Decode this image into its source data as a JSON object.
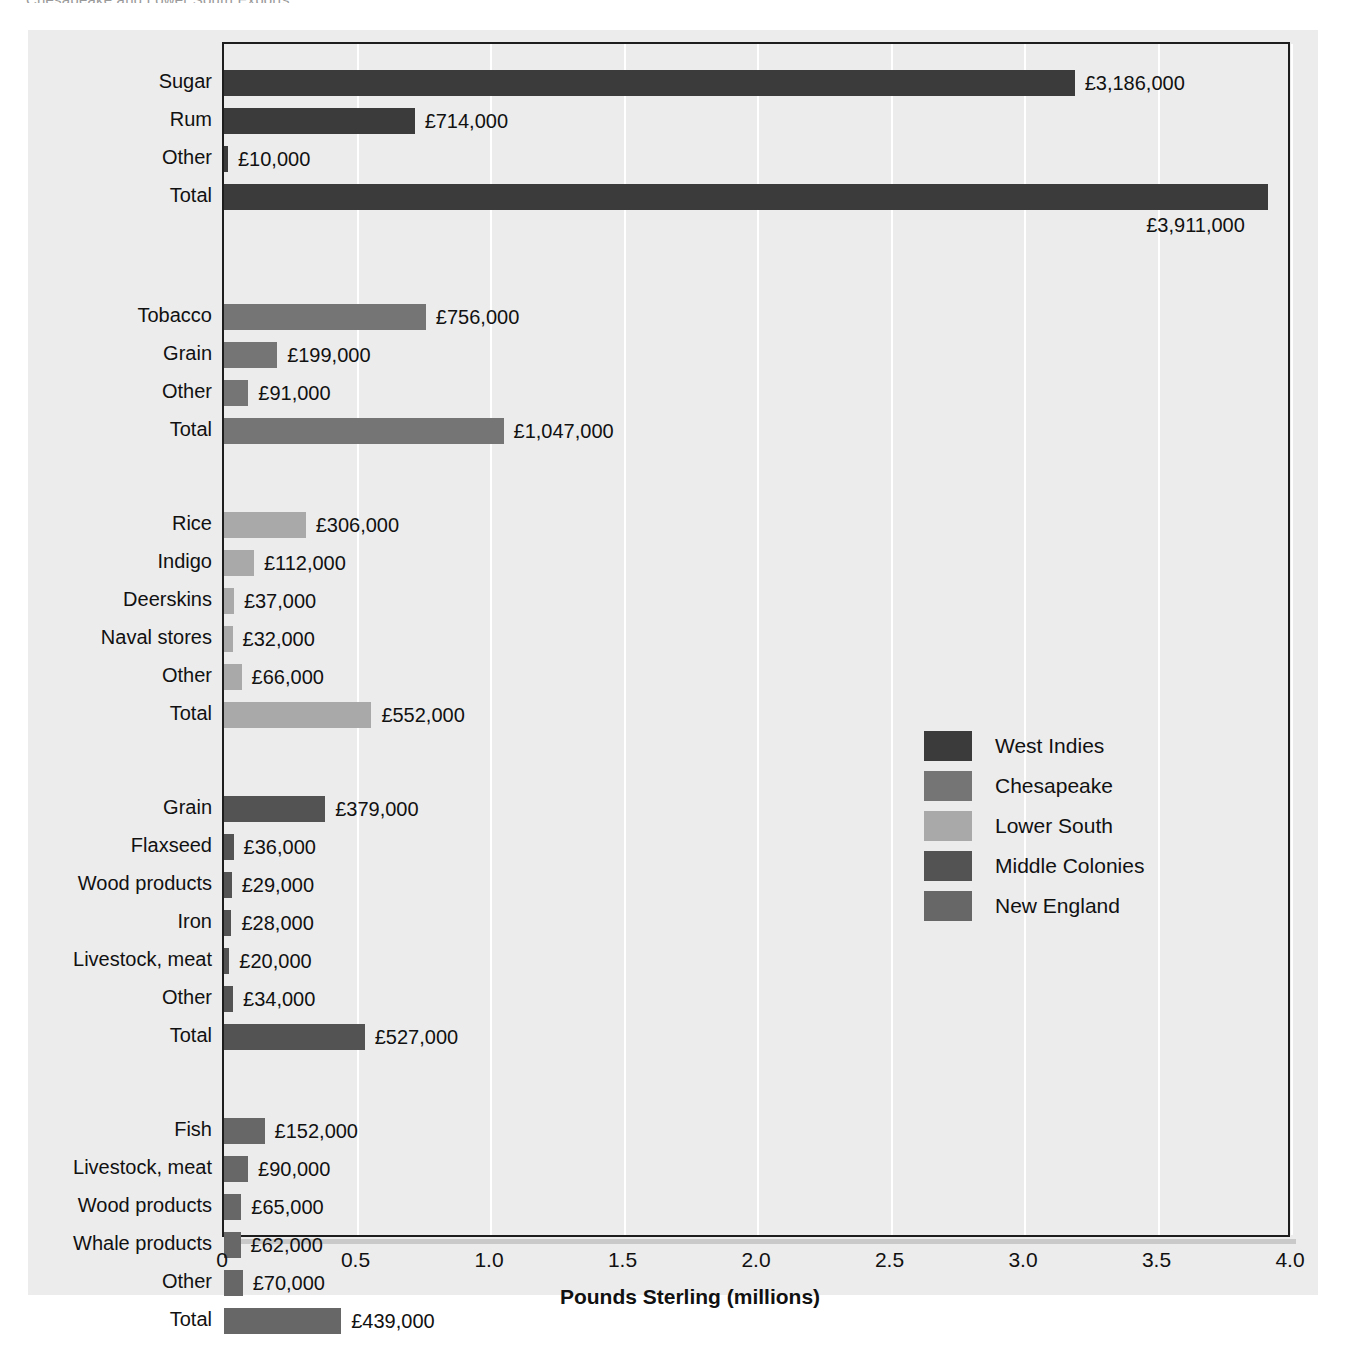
{
  "top_caption": "Chesapeake and Lower South Exports",
  "chart_data": {
    "type": "bar",
    "orientation": "horizontal",
    "title": "",
    "xlabel": "Pounds Sterling (millions)",
    "ylabel": "",
    "xlim": [
      0,
      4.0
    ],
    "xticks": [
      "0",
      "0.5",
      "1.0",
      "1.5",
      "2.0",
      "2.5",
      "3.0",
      "3.5",
      "4.0"
    ],
    "xtick_values": [
      0,
      0.5,
      1.0,
      1.5,
      2.0,
      2.5,
      3.0,
      3.5,
      4.0
    ],
    "grid": true,
    "legend_position": "center-right",
    "value_unit": "pounds sterling",
    "groups": [
      {
        "name": "West Indies",
        "color": "#3b3b3b",
        "items": [
          {
            "label": "Sugar",
            "value": 3186000,
            "value_label": "£3,186,000",
            "millions": 3.186,
            "label_below": false
          },
          {
            "label": "Rum",
            "value": 714000,
            "value_label": "£714,000",
            "millions": 0.714,
            "label_below": false
          },
          {
            "label": "Other",
            "value": 10000,
            "value_label": "£10,000",
            "millions": 0.01,
            "label_below": false
          },
          {
            "label": "Total",
            "value": 3911000,
            "value_label": "£3,911,000",
            "millions": 3.911,
            "label_below": true
          }
        ]
      },
      {
        "name": "Chesapeake",
        "color": "#757575",
        "items": [
          {
            "label": "Tobacco",
            "value": 756000,
            "value_label": "£756,000",
            "millions": 0.756,
            "label_below": false
          },
          {
            "label": "Grain",
            "value": 199000,
            "value_label": "£199,000",
            "millions": 0.199,
            "label_below": false
          },
          {
            "label": "Other",
            "value": 91000,
            "value_label": "£91,000",
            "millions": 0.091,
            "label_below": false
          },
          {
            "label": "Total",
            "value": 1047000,
            "value_label": "£1,047,000",
            "millions": 1.047,
            "label_below": false
          }
        ]
      },
      {
        "name": "Lower South",
        "color": "#a9a9a9",
        "items": [
          {
            "label": "Rice",
            "value": 306000,
            "value_label": "£306,000",
            "millions": 0.306,
            "label_below": false
          },
          {
            "label": "Indigo",
            "value": 112000,
            "value_label": "£112,000",
            "millions": 0.112,
            "label_below": false
          },
          {
            "label": "Deerskins",
            "value": 37000,
            "value_label": "£37,000",
            "millions": 0.037,
            "label_below": false
          },
          {
            "label": "Naval stores",
            "value": 32000,
            "value_label": "£32,000",
            "millions": 0.032,
            "label_below": false
          },
          {
            "label": "Other",
            "value": 66000,
            "value_label": "£66,000",
            "millions": 0.066,
            "label_below": false
          },
          {
            "label": "Total",
            "value": 552000,
            "value_label": "£552,000",
            "millions": 0.552,
            "label_below": false
          }
        ]
      },
      {
        "name": "Middle Colonies",
        "color": "#535353",
        "items": [
          {
            "label": "Grain",
            "value": 379000,
            "value_label": "£379,000",
            "millions": 0.379,
            "label_below": false
          },
          {
            "label": "Flaxseed",
            "value": 36000,
            "value_label": "£36,000",
            "millions": 0.036,
            "label_below": false
          },
          {
            "label": "Wood products",
            "value": 29000,
            "value_label": "£29,000",
            "millions": 0.029,
            "label_below": false
          },
          {
            "label": "Iron",
            "value": 28000,
            "value_label": "£28,000",
            "millions": 0.028,
            "label_below": false
          },
          {
            "label": "Livestock, meat",
            "value": 20000,
            "value_label": "£20,000",
            "millions": 0.02,
            "label_below": false
          },
          {
            "label": "Other",
            "value": 34000,
            "value_label": "£34,000",
            "millions": 0.034,
            "label_below": false
          },
          {
            "label": "Total",
            "value": 527000,
            "value_label": "£527,000",
            "millions": 0.527,
            "label_below": false
          }
        ]
      },
      {
        "name": "New England",
        "color": "#676767",
        "items": [
          {
            "label": "Fish",
            "value": 152000,
            "value_label": "£152,000",
            "millions": 0.152,
            "label_below": false
          },
          {
            "label": "Livestock, meat",
            "value": 90000,
            "value_label": "£90,000",
            "millions": 0.09,
            "label_below": false
          },
          {
            "label": "Wood products",
            "value": 65000,
            "value_label": "£65,000",
            "millions": 0.065,
            "label_below": false
          },
          {
            "label": "Whale products",
            "value": 62000,
            "value_label": "£62,000",
            "millions": 0.062,
            "label_below": false
          },
          {
            "label": "Other",
            "value": 70000,
            "value_label": "£70,000",
            "millions": 0.07,
            "label_below": false
          },
          {
            "label": "Total",
            "value": 439000,
            "value_label": "£439,000",
            "millions": 0.439,
            "label_below": false
          }
        ]
      }
    ],
    "legend": [
      {
        "label": "West Indies",
        "color": "#3b3b3b"
      },
      {
        "label": "Chesapeake",
        "color": "#757575"
      },
      {
        "label": "Lower South",
        "color": "#a9a9a9"
      },
      {
        "label": "Middle Colonies",
        "color": "#535353"
      },
      {
        "label": "New England",
        "color": "#676767"
      }
    ]
  },
  "colors": {
    "panel_background": "#ececed",
    "plot_border": "#1d1d1d",
    "gridline": "#ffffff",
    "text": "#111111"
  }
}
